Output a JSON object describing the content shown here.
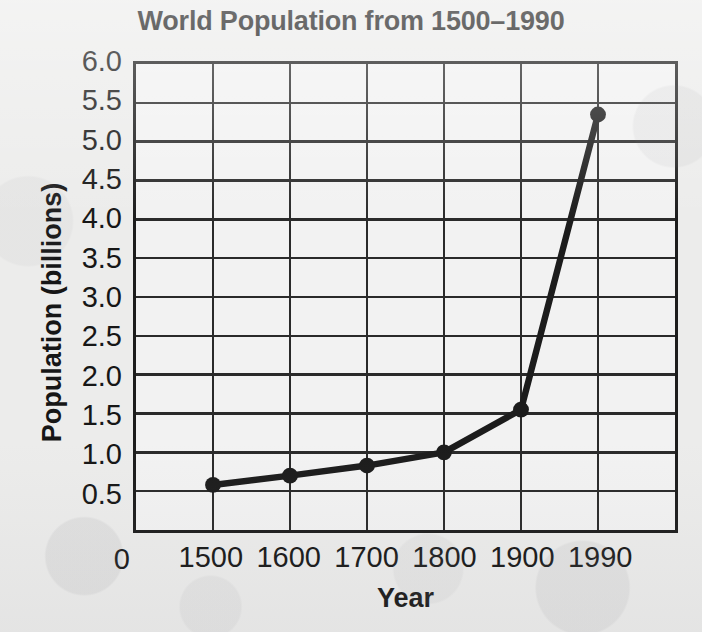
{
  "chart_data": {
    "type": "line",
    "title": "World Population from 1500–1990",
    "xlabel": "Year",
    "ylabel": "Population (billions)",
    "x": [
      1500,
      1600,
      1700,
      1800,
      1900,
      1990
    ],
    "values": [
      0.58,
      0.7,
      0.83,
      1.0,
      1.55,
      5.35
    ],
    "categories": [
      "1500",
      "1600",
      "1700",
      "1800",
      "1900",
      "1990"
    ],
    "series": [
      {
        "name": "World population",
        "values": [
          0.58,
          0.7,
          0.83,
          1.0,
          1.55,
          5.35
        ]
      }
    ],
    "xlim": [
      1450,
      2040
    ],
    "ylim": [
      0,
      6.0
    ],
    "x_tick_labels": [
      "0",
      "1500",
      "1600",
      "1700",
      "1800",
      "1900",
      "1990"
    ],
    "y_tick_labels": [
      "6.0",
      "5.5",
      "5.0",
      "4.5",
      "4.0",
      "3.5",
      "3.0",
      "2.5",
      "2.0",
      "1.5",
      "1.0",
      "0.5"
    ],
    "y_tick_values": [
      6.0,
      5.5,
      5.0,
      4.5,
      4.0,
      3.5,
      3.0,
      2.5,
      2.0,
      1.5,
      1.0,
      0.5
    ],
    "y_zero_label": "0",
    "grid": true,
    "legend": "none",
    "marker": "filled-circle",
    "line_color": "#1c1c1c",
    "grid_color": "#2a2a2a",
    "background_color": "#ececeb"
  }
}
